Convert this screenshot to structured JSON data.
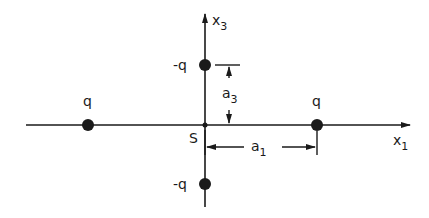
{
  "diagram": {
    "axes": {
      "x1_label": "x",
      "x1_sub": "1",
      "x3_label": "x",
      "x3_sub": "3"
    },
    "origin_label": "S",
    "charges": [
      {
        "label": "q",
        "position": "left on x1 axis"
      },
      {
        "label": "q",
        "position": "right on x1 axis"
      },
      {
        "label": "-q",
        "position": "top on x3 axis"
      },
      {
        "label": "-q",
        "position": "bottom on x3 axis"
      }
    ],
    "dimensions": {
      "a1_label": "a",
      "a1_sub": "1",
      "a3_label": "a",
      "a3_sub": "3"
    },
    "colors": {
      "ink": "#1a1a1a",
      "background": "#ffffff"
    }
  }
}
